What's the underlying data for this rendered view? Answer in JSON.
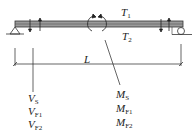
{
  "diagram": {
    "beam_labels": {
      "top": "T",
      "top_sub": "1",
      "bottom": "T",
      "bottom_sub": "2"
    },
    "span_label": "L",
    "shear_labels": [
      {
        "main": "V",
        "sub": "S"
      },
      {
        "main": "V",
        "sub": "F1"
      },
      {
        "main": "V",
        "sub": "F2"
      }
    ],
    "moment_labels": [
      {
        "main": "M",
        "sub": "S"
      },
      {
        "main": "M",
        "sub": "F1"
      },
      {
        "main": "M",
        "sub": "F2"
      }
    ],
    "colors": {
      "line": "#222222",
      "beam_fill": "#9a9a9a"
    }
  }
}
